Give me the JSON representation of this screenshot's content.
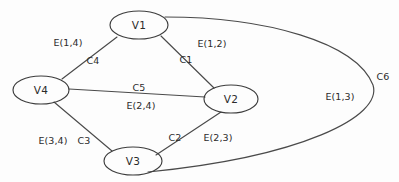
{
  "diagram": {
    "type": "graph",
    "title": "",
    "background_color": "#fdfdfd",
    "stroke_color": "#4a4a4a",
    "text_color": "#2b2b2b",
    "nodes": [
      {
        "id": "V1",
        "label": "V1",
        "cx": 139,
        "cy": 25,
        "rx": 29,
        "ry": 14
      },
      {
        "id": "V2",
        "label": "V2",
        "cx": 231,
        "cy": 99,
        "rx": 27,
        "ry": 14
      },
      {
        "id": "V3",
        "label": "V3",
        "cx": 133,
        "cy": 161,
        "rx": 29,
        "ry": 14
      },
      {
        "id": "V4",
        "label": "V4",
        "cx": 41,
        "cy": 90,
        "rx": 28,
        "ry": 14
      }
    ],
    "edges": [
      {
        "id": "C4",
        "from": "V4",
        "to": "V1",
        "capacity_label": "C4",
        "edge_label": "E(1,4)"
      },
      {
        "id": "C1",
        "from": "V1",
        "to": "V2",
        "capacity_label": "C1",
        "edge_label": "E(1,2)"
      },
      {
        "id": "C5",
        "from": "V4",
        "to": "V2",
        "capacity_label": "C5",
        "edge_label": "E(2,4)"
      },
      {
        "id": "C3",
        "from": "V4",
        "to": "V3",
        "capacity_label": "C3",
        "edge_label": "E(3,4)"
      },
      {
        "id": "C2",
        "from": "V2",
        "to": "V3",
        "capacity_label": "C2",
        "edge_label": "E(2,3)"
      },
      {
        "id": "C6",
        "from": "V1",
        "to": "V3",
        "capacity_label": "C6",
        "edge_label": "E(1,3)"
      }
    ],
    "node_label_positions": [
      {
        "label": "V1",
        "x": 139,
        "y": 25
      },
      {
        "label": "V2",
        "x": 231,
        "y": 99
      },
      {
        "label": "V3",
        "x": 133,
        "y": 161
      },
      {
        "label": "V4",
        "x": 41,
        "y": 90
      }
    ],
    "edge_label_positions": [
      {
        "label": "E(1,4)",
        "x": 68,
        "y": 42
      },
      {
        "label": "E(1,2)",
        "x": 212,
        "y": 43
      },
      {
        "label": "E(2,4)",
        "x": 141,
        "y": 105
      },
      {
        "label": "E(3,4)",
        "x": 53,
        "y": 140
      },
      {
        "label": "E(2,3)",
        "x": 218,
        "y": 137
      },
      {
        "label": "E(1,3)",
        "x": 340,
        "y": 96
      }
    ],
    "capacity_label_positions": [
      {
        "label": "C4",
        "x": 93,
        "y": 60
      },
      {
        "label": "C1",
        "x": 186,
        "y": 59
      },
      {
        "label": "C5",
        "x": 139,
        "y": 87
      },
      {
        "label": "C3",
        "x": 84,
        "y": 140
      },
      {
        "label": "C2",
        "x": 175,
        "y": 137
      },
      {
        "label": "C6",
        "x": 383,
        "y": 76
      }
    ]
  }
}
